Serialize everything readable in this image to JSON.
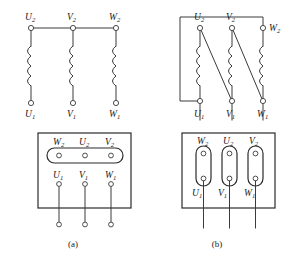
{
  "figure": {
    "line_color": "#3a3a3a",
    "box_color": "#2b2b2b",
    "background": "#ffffff"
  },
  "panels": [
    {
      "id": "a",
      "caption": "(a)",
      "connection": "star",
      "schematic": {
        "top_terminals": [
          {
            "name": "U2",
            "base": "U",
            "sub": "2"
          },
          {
            "name": "V2",
            "base": "V",
            "sub": "2"
          },
          {
            "name": "W2",
            "base": "W",
            "sub": "2"
          }
        ],
        "bottom_terminals": [
          {
            "name": "U1",
            "base": "U",
            "sub": "1"
          },
          {
            "name": "V1",
            "base": "V",
            "sub": "1"
          },
          {
            "name": "W1",
            "base": "W",
            "sub": "1"
          }
        ],
        "coil_count": 3,
        "bus": "horizontal-bus-joining-U2-V2-W2"
      },
      "terminal_block": {
        "top_row": [
          {
            "name": "W2",
            "base": "W",
            "sub": "2"
          },
          {
            "name": "U2",
            "base": "U",
            "sub": "2"
          },
          {
            "name": "V2",
            "base": "V",
            "sub": "2"
          }
        ],
        "bottom_row": [
          {
            "name": "U1",
            "base": "U",
            "sub": "1"
          },
          {
            "name": "V1",
            "base": "V",
            "sub": "1"
          },
          {
            "name": "W1",
            "base": "W",
            "sub": "1"
          }
        ],
        "links": [
          {
            "orientation": "horizontal",
            "spans": [
              "W2",
              "U2",
              "V2"
            ]
          }
        ],
        "lead_count": 3,
        "lead_end_marker": "circle"
      }
    },
    {
      "id": "b",
      "caption": "(b)",
      "connection": "delta",
      "schematic": {
        "top_terminals": [
          {
            "name": "U2",
            "base": "U",
            "sub": "2"
          },
          {
            "name": "V2",
            "base": "V",
            "sub": "2"
          },
          {
            "name": "W2",
            "base": "W",
            "sub": "2"
          }
        ],
        "bottom_terminals": [
          {
            "name": "U1",
            "base": "U",
            "sub": "1"
          },
          {
            "name": "V1",
            "base": "V",
            "sub": "1"
          },
          {
            "name": "W1",
            "base": "W",
            "sub": "1"
          }
        ],
        "coil_count": 3,
        "links": [
          {
            "from": "U2",
            "to": "V1"
          },
          {
            "from": "V2",
            "to": "W1"
          },
          {
            "from": "W2",
            "to": "U1",
            "route": "around-top-left"
          }
        ]
      },
      "terminal_block": {
        "top_row": [
          {
            "name": "W2",
            "base": "W",
            "sub": "2"
          },
          {
            "name": "U2",
            "base": "U",
            "sub": "2"
          },
          {
            "name": "V2",
            "base": "V",
            "sub": "2"
          }
        ],
        "bottom_row": [
          {
            "name": "U1",
            "base": "U",
            "sub": "1"
          },
          {
            "name": "V1",
            "base": "V",
            "sub": "1"
          },
          {
            "name": "W1",
            "base": "W",
            "sub": "1"
          }
        ],
        "links": [
          {
            "orientation": "vertical",
            "spans": [
              "W2",
              "U1"
            ]
          },
          {
            "orientation": "vertical",
            "spans": [
              "U2",
              "V1"
            ]
          },
          {
            "orientation": "vertical",
            "spans": [
              "V2",
              "W1"
            ]
          }
        ],
        "lead_count": 3,
        "lead_end_marker": "none"
      }
    }
  ]
}
